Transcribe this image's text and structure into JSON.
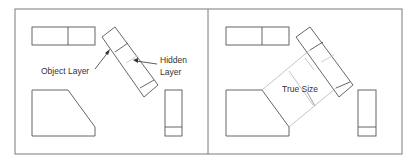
{
  "colors": {
    "frame": "#7a7a7a",
    "object": "#555555",
    "projection": "#b5b5b5",
    "text": "#333333",
    "background": "#ffffff"
  },
  "left_panel": {
    "labels": {
      "object_layer": "Object Layer",
      "hidden_line1": "Hidden",
      "hidden_line2": "Layer"
    }
  },
  "right_panel": {
    "labels": {
      "true_size": "True Size"
    }
  }
}
